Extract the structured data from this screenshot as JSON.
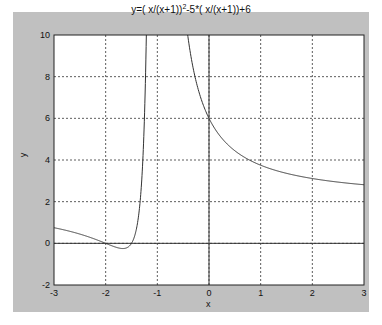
{
  "chart_data": {
    "type": "line",
    "title_parts": {
      "pre": "y=( x/(x+1))",
      "sup": "2",
      "post": "-5*( x/(x+1))+6"
    },
    "xlabel": "x",
    "ylabel": "y",
    "xlim": [
      -3,
      3
    ],
    "ylim": [
      -2,
      10
    ],
    "xticks": [
      -3,
      -2,
      -1,
      0,
      1,
      2,
      3
    ],
    "yticks": [
      -2,
      0,
      2,
      4,
      6,
      8,
      10
    ],
    "grid": true,
    "axis_lines": {
      "x0": true,
      "y0": true
    },
    "function": "y = (x/(x+1))^2 - 5*(x/(x+1)) + 6",
    "asymptote_x": -1,
    "series": [
      {
        "name": "y",
        "color": "#333333",
        "sample_points": [
          [
            -3,
            0.75
          ],
          [
            -2.5,
            -0.06
          ],
          [
            -2,
            0
          ],
          [
            -1.67,
            -0.25
          ],
          [
            -1.5,
            0
          ],
          [
            -1.3,
            4.9
          ],
          [
            -0.5,
            12
          ],
          [
            -0.33,
            8.75
          ],
          [
            0,
            6
          ],
          [
            0.5,
            4.44
          ],
          [
            1,
            3.75
          ],
          [
            2,
            3.11
          ],
          [
            3,
            2.81
          ]
        ]
      }
    ]
  },
  "colors": {
    "figure_bg": "#c0c0c0",
    "plot_bg": "#ffffff",
    "line": "#333333",
    "grid": "#333333"
  }
}
